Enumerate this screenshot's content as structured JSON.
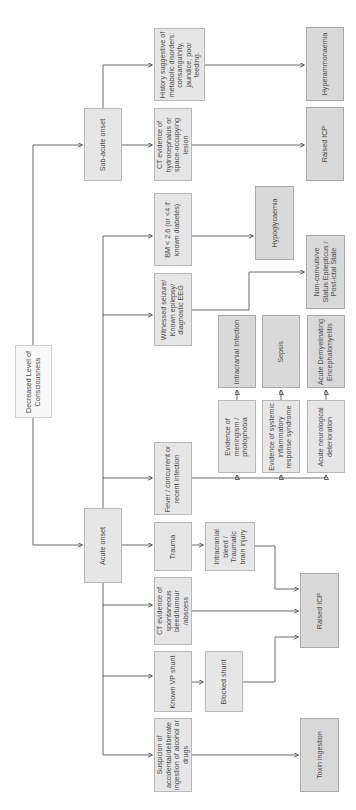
{
  "diagram": {
    "type": "flowchart",
    "orientation": "rotated-90-ccw",
    "colors": {
      "box_fill": "#e6e6e6",
      "result_fill": "#d9d9d9",
      "root_fill": "#f8f8f8",
      "line": "#444444",
      "text": "#4a4a4a"
    },
    "nodes": {
      "root": "Decreased Level of Consciousness",
      "subacute": "Sub-acute onset",
      "acute": "Acute onset",
      "history_metabolic": "History suggestive of metabolic disorders: consanguinity, jaundice, poor feeding.",
      "ct_hydro": "CT evidence of hydrocephalus or space-occupying lesion",
      "bm": "BM < 2.6 (or <4 if known diabetes)",
      "witnessed_seizure": "Witnessed seizure/ Known epilepsy/ diagnostic EEG",
      "fever": "Fever / concurrent or recent infection",
      "trauma": "Trauma",
      "ct_spontaneous": "CT evidence of spontaneous bleed/tumour /abscess",
      "known_vp": "Known VP shunt",
      "suspicion": "Suspicion of accidental/deliberate ingestion of alcohol or drugs",
      "intracranial_bleed": "Intracranial bleed / Traumatic brain injury",
      "blocked_shunt": "Blocked shunt",
      "evidence_meningism": "Evidence of meningism / photophobia",
      "evidence_sirs": "Evidence of systemic inflammatory response syndrome",
      "acute_neuro": "Acute neurological deterioration",
      "hyperammonaemia": "Hyperammonaemia",
      "raised_icp_top": "Raised ICP",
      "hypoglycaemia": "Hypoglycaemia",
      "ncse": "Non-convulsive Status Epilepticus / Post-ictal State",
      "intracranial_infection": "Intracranial Infection",
      "sepsis": "Sepsis",
      "adem": "Acute Demyelinating Encephalomyelitis",
      "raised_icp_mid": "Raised ICP",
      "toxin": "Toxin ingestion"
    },
    "edges": [
      [
        "root",
        "subacute"
      ],
      [
        "root",
        "acute"
      ],
      [
        "subacute",
        "history_metabolic"
      ],
      [
        "subacute",
        "ct_hydro"
      ],
      [
        "history_metabolic",
        "hyperammonaemia"
      ],
      [
        "ct_hydro",
        "raised_icp_top"
      ],
      [
        "acute",
        "bm"
      ],
      [
        "acute",
        "witnessed_seizure"
      ],
      [
        "acute",
        "fever"
      ],
      [
        "acute",
        "trauma"
      ],
      [
        "acute",
        "ct_spontaneous"
      ],
      [
        "acute",
        "known_vp"
      ],
      [
        "acute",
        "suspicion"
      ],
      [
        "bm",
        "hypoglycaemia"
      ],
      [
        "witnessed_seizure",
        "ncse"
      ],
      [
        "fever",
        "evidence_meningism"
      ],
      [
        "fever",
        "evidence_sirs"
      ],
      [
        "fever",
        "acute_neuro"
      ],
      [
        "evidence_meningism",
        "intracranial_infection"
      ],
      [
        "evidence_sirs",
        "sepsis"
      ],
      [
        "acute_neuro",
        "adem"
      ],
      [
        "trauma",
        "intracranial_bleed"
      ],
      [
        "intracranial_bleed",
        "raised_icp_mid"
      ],
      [
        "ct_spontaneous",
        "raised_icp_mid"
      ],
      [
        "known_vp",
        "blocked_shunt"
      ],
      [
        "blocked_shunt",
        "raised_icp_mid"
      ],
      [
        "suspicion",
        "toxin"
      ]
    ]
  }
}
